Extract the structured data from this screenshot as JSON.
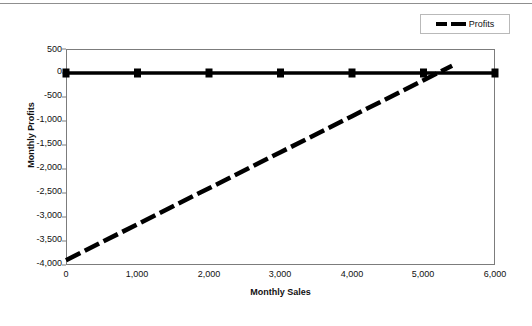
{
  "chart_data": {
    "type": "line",
    "title": "",
    "xlabel": "Monthly Sales",
    "ylabel": "Monthly Profits",
    "xlim": [
      0,
      6000
    ],
    "ylim": [
      -4000,
      500
    ],
    "xticks": [
      "0",
      "1,000",
      "2,000",
      "3,000",
      "4,000",
      "5,000",
      "6,000"
    ],
    "xtick_values": [
      0,
      1000,
      2000,
      3000,
      4000,
      5000,
      6000
    ],
    "yticks": [
      "500",
      "0",
      "-500",
      "-1,000",
      "-1,500",
      "-2,000",
      "-2,500",
      "-3,000",
      "-3,500",
      "-4,000"
    ],
    "ytick_values": [
      500,
      0,
      -500,
      -1000,
      -1500,
      -2000,
      -2500,
      -3000,
      -3500,
      -4000
    ],
    "grid": false,
    "legend_position": "top-right",
    "series": [
      {
        "name": "break-even-reference",
        "style": "solid",
        "color": "#000000",
        "marker": "square",
        "x": [
          0,
          1000,
          2000,
          3000,
          4000,
          5000,
          6000
        ],
        "values": [
          0,
          0,
          0,
          0,
          0,
          0,
          0
        ]
      },
      {
        "name": "Profits",
        "style": "dashed",
        "color": "#000000",
        "marker": "none",
        "x": [
          0,
          1000,
          2000,
          3000,
          4000,
          5000,
          5200,
          5400
        ],
        "values": [
          -3900,
          -3150,
          -2400,
          -1650,
          -900,
          -150,
          0,
          150
        ]
      }
    ]
  },
  "legend": {
    "entries": [
      {
        "label": "Profits",
        "swatch": "dashed-line-black"
      }
    ]
  },
  "axes": {
    "x_title": "Monthly Sales",
    "y_title": "Monthly Profits"
  },
  "colors": {
    "line": "#000000",
    "frame": "#7c7c7c",
    "legend_border": "#b9b9b9",
    "top_rule": "#8f8f8f",
    "background": "#ffffff"
  }
}
